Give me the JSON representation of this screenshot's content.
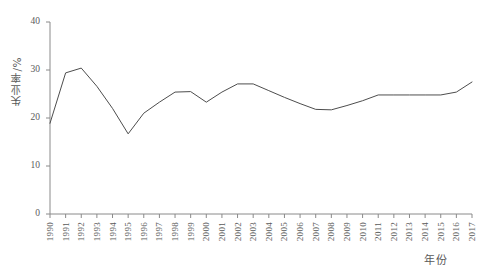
{
  "chart_data": {
    "type": "line",
    "title": "",
    "xlabel": "年份",
    "ylabel": "失业率/%",
    "xlim": [
      1990,
      2017
    ],
    "ylim": [
      0,
      40
    ],
    "yticks": [
      0,
      10,
      20,
      30,
      40
    ],
    "ytick_labels": [
      "0",
      "10",
      "20",
      "30",
      "40"
    ],
    "grid": false,
    "legend": "none",
    "line_color": "#4d4d4d",
    "categories": [
      "1990",
      "1991",
      "1992",
      "1993",
      "1994",
      "1995",
      "1996",
      "1997",
      "1998",
      "1999",
      "2000",
      "2001",
      "2002",
      "2003",
      "2004",
      "2005",
      "2006",
      "2007",
      "2008",
      "2009",
      "2010",
      "2011",
      "2012",
      "2013",
      "2014",
      "2015",
      "2016",
      "2017"
    ],
    "series": [
      {
        "name": "失业率",
        "values": [
          18.9,
          29.4,
          30.4,
          26.6,
          22.0,
          16.7,
          21.0,
          23.3,
          25.4,
          25.5,
          23.3,
          25.4,
          27.1,
          27.1,
          25.7,
          24.3,
          23.0,
          21.8,
          21.7,
          22.6,
          23.6,
          24.8,
          24.8,
          24.8,
          24.8,
          24.8,
          25.4,
          27.5
        ]
      }
    ]
  },
  "axes": {
    "y_axis_title": "失业率/%",
    "x_axis_title": "年份"
  }
}
